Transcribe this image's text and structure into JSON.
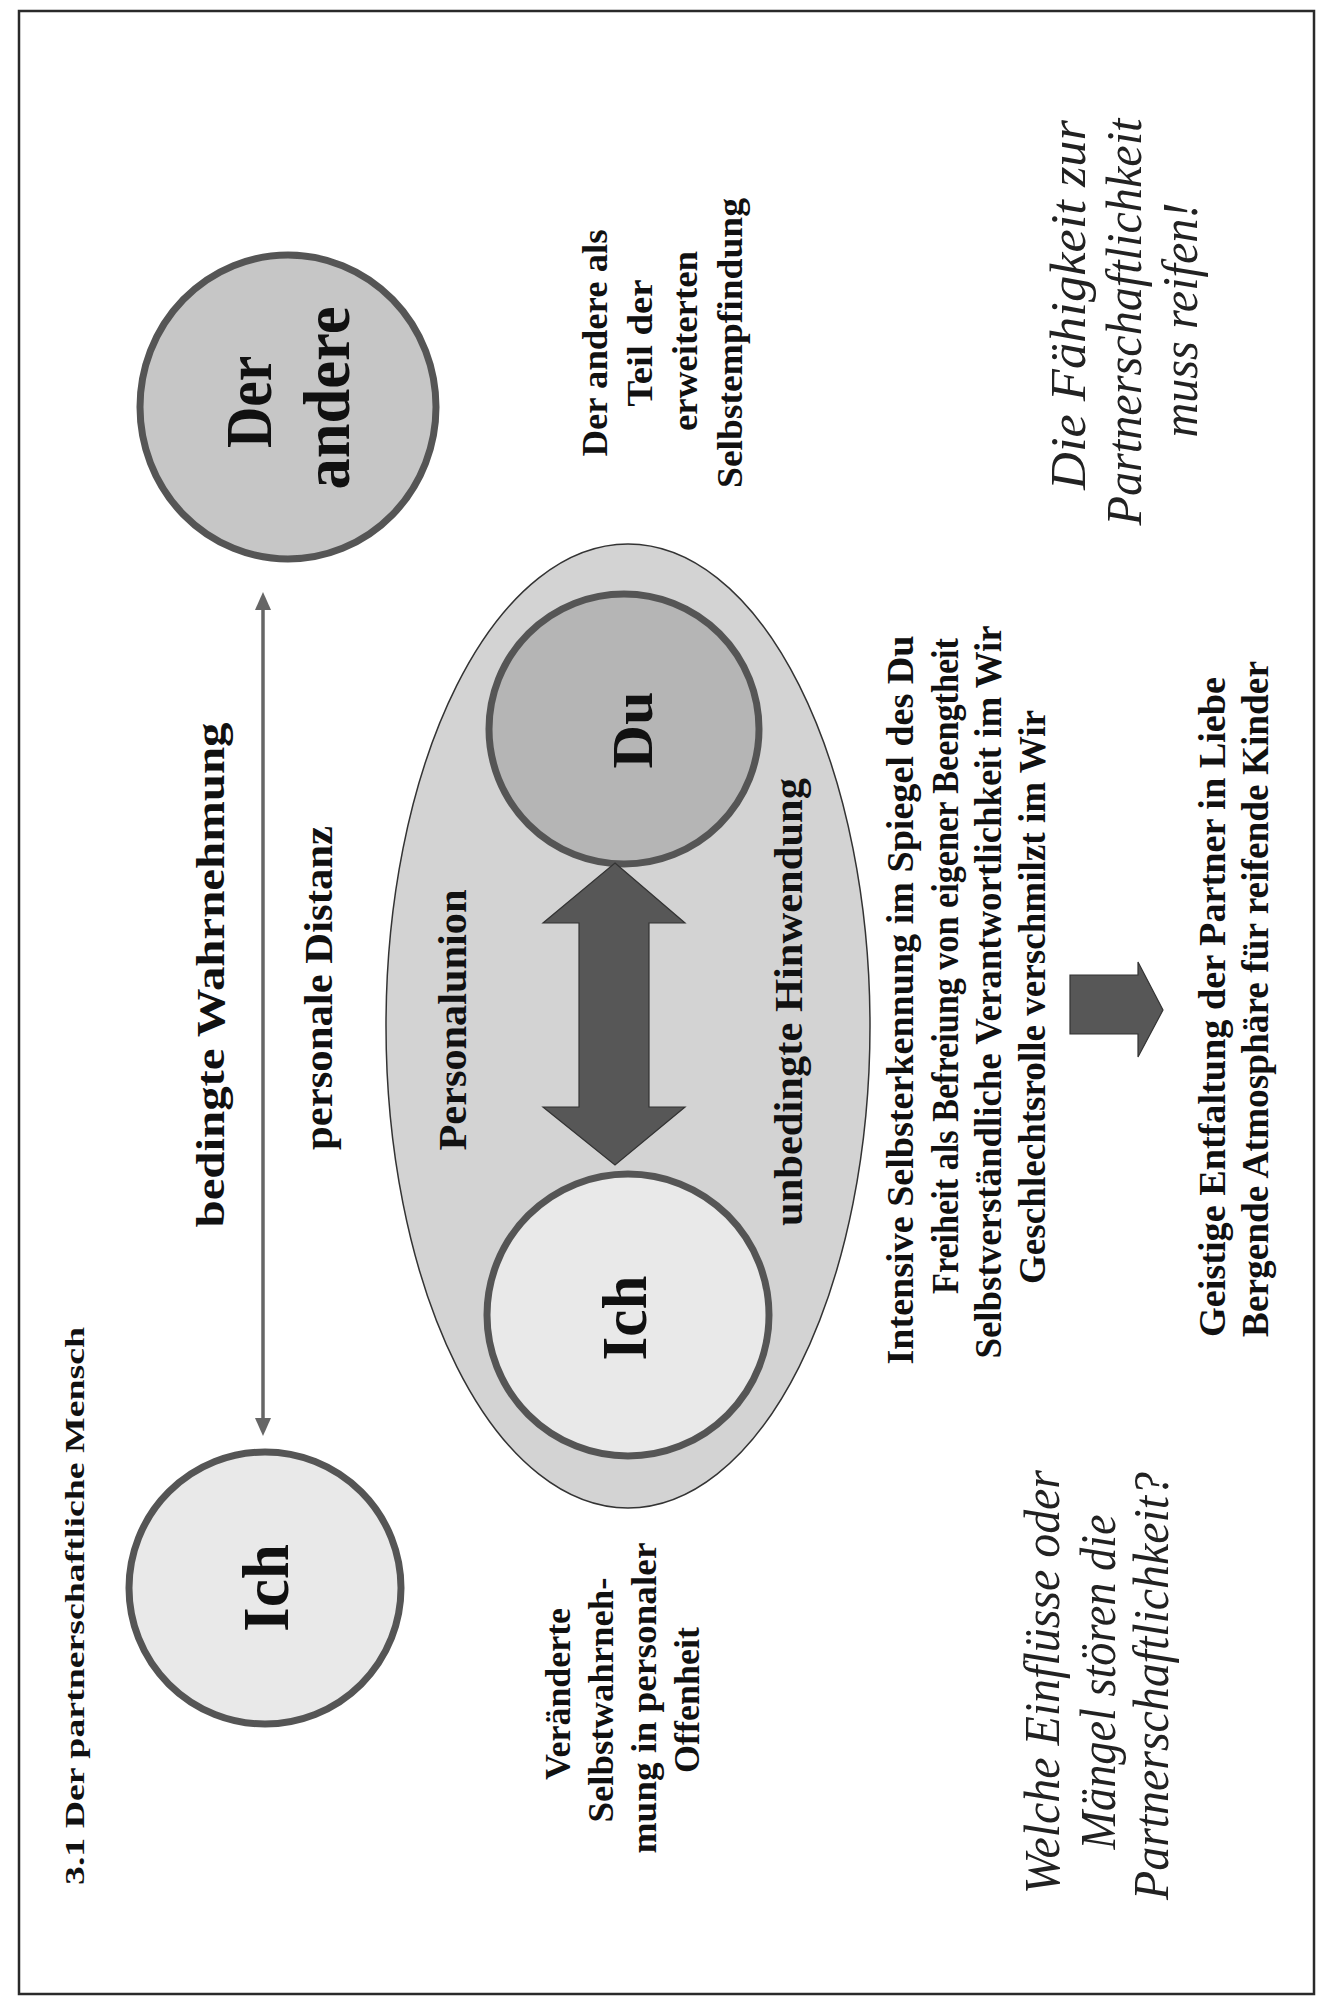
{
  "heading": "3.1  Der partnerschaftliche Mensch",
  "colors": {
    "frame": "#2a2a2a",
    "circle_outline": "#555555",
    "ich_fill": "#e9e9e9",
    "der_andere_fill": "#c6c6c6",
    "du_fill": "#b5b5b5",
    "personalunion_ellipse_fill": "#d3d3d3",
    "arrow_fill": "#575757",
    "connector": "#666666"
  },
  "left_side": {
    "ich_circle": {
      "label": "Ich"
    },
    "der_andere_circle": {
      "label_line1": "Der",
      "label_line2": "andere"
    },
    "connector": {
      "label_top": "bedingte Wahrnehmung",
      "label_bottom": "personale Distanz"
    },
    "ich_note": {
      "lines": [
        "Veränderte",
        "Selbstwahrneh-",
        "mung in personaler",
        "Offenheit"
      ]
    },
    "der_andere_note": {
      "lines": [
        "Der andere als",
        "Teil der",
        "erweiterten",
        "Selbstempfindung"
      ]
    }
  },
  "center": {
    "ellipse_label": "Personalunion",
    "ich_label": "Ich",
    "du_label": "Du",
    "arrow_label": "unbedingte Hinwendung"
  },
  "right_side": {
    "statements": [
      "Intensive Selbsterkennung im Spiegel des Du",
      "Freiheit als Befreiung von eigener Beengtheit",
      "Selbstverständliche Verantwortlichkeit im Wir",
      "Geschlechtsrolle verschmilzt im Wir"
    ],
    "results": [
      "Geistige Entfaltung der Partner in Liebe",
      "Bergende Atmosphäre für reifende Kinder"
    ]
  },
  "italic_notes": {
    "maturity": [
      "Die Fähigkeit zur",
      "Partnerschaftlichkeit",
      "muss reifen!"
    ],
    "question": [
      "Welche Einflüsse oder",
      "Mängel stören die",
      "Partnerschaftlichkeit?"
    ]
  }
}
